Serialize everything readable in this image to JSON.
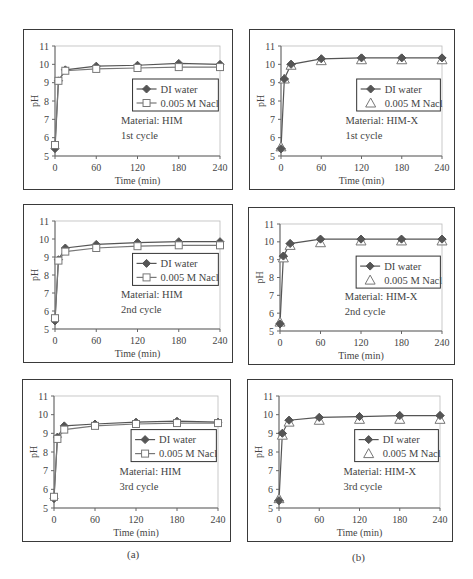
{
  "figure": {
    "sub_labels": [
      {
        "id": "a",
        "text": "(a)",
        "x": 127,
        "y": 548
      },
      {
        "id": "b",
        "text": "(b)",
        "x": 352,
        "y": 551
      }
    ]
  },
  "colors": {
    "di_water": "#555555",
    "nacl": "#777777",
    "axis": "#666666",
    "frame": "#3a3a3a"
  },
  "chart_data": [
    {
      "id": "a1",
      "type": "line",
      "panel": {
        "x": 23,
        "y": 29,
        "w": 210,
        "h": 161
      },
      "title": "",
      "xlabel": "Time (min)",
      "ylabel": "pH",
      "xlim": [
        0,
        240
      ],
      "ylim": [
        5,
        11
      ],
      "xticks": [
        0,
        60,
        120,
        180,
        240
      ],
      "yticks": [
        5,
        6,
        7,
        8,
        9,
        10,
        11
      ],
      "grid": false,
      "annotations": [
        "Material: HIM",
        "1st cycle"
      ],
      "legend": {
        "position": "inside-right",
        "entries": [
          "DI water",
          "0.005 M Nacl"
        ]
      },
      "x": [
        0,
        5,
        15,
        60,
        120,
        180,
        240
      ],
      "series": [
        {
          "name": "DI water",
          "marker": "diamond-filled",
          "line": true,
          "values": [
            5.4,
            9.1,
            9.7,
            9.9,
            9.95,
            10.05,
            10.0
          ]
        },
        {
          "name": "0.005 M Nacl",
          "marker": "square-open",
          "line": true,
          "values": [
            5.6,
            9.1,
            9.65,
            9.75,
            9.8,
            9.85,
            9.85
          ]
        }
      ]
    },
    {
      "id": "b1",
      "type": "line",
      "panel": {
        "x": 249,
        "y": 29,
        "w": 206,
        "h": 161
      },
      "title": "",
      "xlabel": "Time (min)",
      "ylabel": "pH",
      "xlim": [
        0,
        240
      ],
      "ylim": [
        5,
        11
      ],
      "xticks": [
        0,
        60,
        120,
        180,
        240
      ],
      "yticks": [
        5,
        6,
        7,
        8,
        9,
        10,
        11
      ],
      "grid": false,
      "annotations": [
        "Material: HIM-X",
        "1st cycle"
      ],
      "legend": {
        "position": "inside-right",
        "entries": [
          "DI water",
          "0.005 M Nacl"
        ]
      },
      "x": [
        0,
        5,
        15,
        60,
        120,
        180,
        240
      ],
      "series": [
        {
          "name": "DI water",
          "marker": "diamond-filled",
          "line": true,
          "values": [
            5.4,
            9.2,
            10.0,
            10.3,
            10.35,
            10.35,
            10.35
          ]
        },
        {
          "name": "0.005 M Nacl",
          "marker": "triangle-open",
          "line": false,
          "values": [
            5.5,
            9.2,
            9.95,
            10.2,
            10.25,
            10.25,
            10.25
          ]
        }
      ]
    },
    {
      "id": "a2",
      "type": "line",
      "panel": {
        "x": 23,
        "y": 204,
        "w": 210,
        "h": 159
      },
      "title": "",
      "xlabel": "Time (min)",
      "ylabel": "pH",
      "xlim": [
        0,
        240
      ],
      "ylim": [
        5,
        11
      ],
      "xticks": [
        0,
        60,
        120,
        180,
        240
      ],
      "yticks": [
        5,
        6,
        7,
        8,
        9,
        10,
        11
      ],
      "grid": false,
      "annotations": [
        "Material: HIM",
        "2nd cycle"
      ],
      "legend": {
        "position": "inside-right",
        "entries": [
          "DI water",
          "0.005 M Nacl"
        ]
      },
      "x": [
        0,
        5,
        15,
        60,
        120,
        180,
        240
      ],
      "series": [
        {
          "name": "DI water",
          "marker": "diamond-filled",
          "line": true,
          "values": [
            5.45,
            8.85,
            9.5,
            9.7,
            9.8,
            9.85,
            9.85
          ]
        },
        {
          "name": "0.005 M Nacl",
          "marker": "square-open",
          "line": true,
          "values": [
            5.6,
            8.8,
            9.3,
            9.5,
            9.6,
            9.65,
            9.65
          ]
        }
      ]
    },
    {
      "id": "b2",
      "type": "line",
      "panel": {
        "x": 248,
        "y": 207,
        "w": 207,
        "h": 158
      },
      "title": "",
      "xlabel": "Time (min)",
      "ylabel": "pH",
      "xlim": [
        0,
        240
      ],
      "ylim": [
        5,
        11
      ],
      "xticks": [
        0,
        60,
        120,
        180,
        240
      ],
      "yticks": [
        5,
        6,
        7,
        8,
        9,
        10,
        11
      ],
      "grid": false,
      "annotations": [
        "Material: HIM-X",
        "2nd cycle"
      ],
      "legend": {
        "position": "inside-right",
        "entries": [
          "DI water",
          "0.005 M Nacl"
        ]
      },
      "x": [
        0,
        5,
        15,
        60,
        120,
        180,
        240
      ],
      "series": [
        {
          "name": "DI water",
          "marker": "diamond-filled",
          "line": true,
          "values": [
            5.4,
            9.2,
            9.9,
            10.15,
            10.15,
            10.15,
            10.15
          ]
        },
        {
          "name": "0.005 M Nacl",
          "marker": "triangle-open",
          "line": false,
          "values": [
            5.5,
            9.1,
            9.8,
            9.95,
            10.05,
            10.05,
            10.05
          ]
        }
      ]
    },
    {
      "id": "a3",
      "type": "line",
      "panel": {
        "x": 22,
        "y": 379,
        "w": 209,
        "h": 163
      },
      "title": "",
      "xlabel": "Time (min)",
      "ylabel": "pH",
      "xlim": [
        0,
        240
      ],
      "ylim": [
        5,
        11
      ],
      "xticks": [
        0,
        60,
        120,
        180,
        240
      ],
      "yticks": [
        5,
        6,
        7,
        8,
        9,
        10,
        11
      ],
      "grid": false,
      "annotations": [
        "Material: HIM",
        "3rd cycle"
      ],
      "legend": {
        "position": "inside-right",
        "entries": [
          "DI water",
          "0.005 M Nacl"
        ]
      },
      "x": [
        0,
        5,
        15,
        60,
        120,
        180,
        240
      ],
      "series": [
        {
          "name": "DI water",
          "marker": "diamond-filled",
          "line": true,
          "values": [
            5.5,
            8.8,
            9.4,
            9.5,
            9.6,
            9.65,
            9.6
          ]
        },
        {
          "name": "0.005 M Nacl",
          "marker": "square-open",
          "line": true,
          "values": [
            5.6,
            8.7,
            9.2,
            9.4,
            9.5,
            9.55,
            9.55
          ]
        }
      ]
    },
    {
      "id": "b3",
      "type": "line",
      "panel": {
        "x": 247,
        "y": 379,
        "w": 206,
        "h": 163
      },
      "title": "",
      "xlabel": "Time (min)",
      "ylabel": "pH",
      "xlim": [
        0,
        240
      ],
      "ylim": [
        5,
        11
      ],
      "xticks": [
        0,
        60,
        120,
        180,
        240
      ],
      "yticks": [
        5,
        6,
        7,
        8,
        9,
        10,
        11
      ],
      "grid": false,
      "annotations": [
        "Material: HIM-X",
        "3rd cycle"
      ],
      "legend": {
        "position": "inside-right",
        "entries": [
          "DI water",
          "0.005 M Nacl"
        ]
      },
      "x": [
        0,
        5,
        15,
        60,
        120,
        180,
        240
      ],
      "series": [
        {
          "name": "DI water",
          "marker": "diamond-filled",
          "line": true,
          "values": [
            5.4,
            9.0,
            9.7,
            9.85,
            9.9,
            9.95,
            9.95
          ]
        },
        {
          "name": "0.005 M Nacl",
          "marker": "triangle-open",
          "line": false,
          "values": [
            5.5,
            8.9,
            9.6,
            9.7,
            9.75,
            9.75,
            9.75
          ]
        }
      ]
    }
  ]
}
